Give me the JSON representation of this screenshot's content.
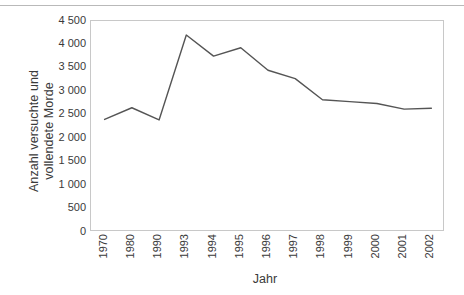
{
  "chart_data": {
    "type": "line",
    "title": "",
    "subtitle": "",
    "xlabel": "Jahr",
    "ylabel": "Anzahl versuchte und vollendete Morde",
    "ylabel_lines": [
      "Anzahl versuchte und",
      "vollendete Morde"
    ],
    "categories": [
      "1970",
      "1980",
      "1990",
      "1993",
      "1994",
      "1995",
      "1996",
      "1997",
      "1998",
      "1999",
      "2000",
      "2001",
      "2002"
    ],
    "values": [
      2400,
      2650,
      2390,
      4200,
      3750,
      3930,
      3450,
      3270,
      2820,
      2780,
      2740,
      2620,
      2640
    ],
    "series": [
      {
        "name": "Anzahl versuchte und vollendete Morde",
        "values": [
          2400,
          2650,
          2390,
          4200,
          3750,
          3930,
          3450,
          3270,
          2820,
          2780,
          2740,
          2620,
          2640
        ]
      }
    ],
    "ylim": [
      0,
      4500
    ],
    "ytick_values": [
      0,
      500,
      1000,
      1500,
      2000,
      2500,
      3000,
      3500,
      4000,
      4500
    ],
    "ytick_labels": [
      "0",
      "500",
      "1 000",
      "1 500",
      "2 000",
      "2 500",
      "3 000",
      "3 500",
      "4 000",
      "4 500"
    ],
    "xtick_labels": [
      "1970",
      "1980",
      "1990",
      "1993",
      "1994",
      "1995",
      "1996",
      "1997",
      "1998",
      "1999",
      "2000",
      "2001",
      "2002"
    ],
    "grid": false,
    "legend": "none",
    "line_color": "#555555",
    "plot_border_color": "#c8c8c8",
    "text_color": "#3a3a3a",
    "background_color": "#ffffff",
    "annotations": []
  }
}
